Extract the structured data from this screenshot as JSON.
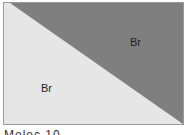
{
  "diagram": {
    "regions": [
      {
        "name": "upper-right-triangle",
        "label": "Br",
        "color": "#7f7f7f"
      },
      {
        "name": "lower-left-triangle",
        "label": "Br",
        "color": "#e6e6e6"
      }
    ],
    "border_color": "#9a9a9a"
  },
  "caption": {
    "text": "Molec 10"
  }
}
